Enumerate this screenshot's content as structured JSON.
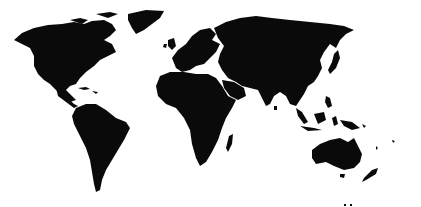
{
  "map": {
    "type": "world-silhouette",
    "background_color": "#ffffff",
    "land_color": "#0a0a0a",
    "regions": [
      {
        "name": "north-america"
      },
      {
        "name": "greenland"
      },
      {
        "name": "south-america"
      },
      {
        "name": "europe"
      },
      {
        "name": "africa"
      },
      {
        "name": "asia"
      },
      {
        "name": "australia"
      },
      {
        "name": "new-zealand"
      },
      {
        "name": "madagascar"
      },
      {
        "name": "indonesia"
      },
      {
        "name": "japan"
      },
      {
        "name": "uk"
      }
    ]
  }
}
